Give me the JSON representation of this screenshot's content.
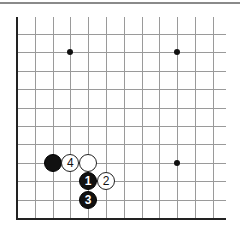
{
  "board": {
    "grid": {
      "x0": 17,
      "dx": 17.8,
      "columns": 12,
      "x_end": 226,
      "y_top": 17,
      "y0": 34,
      "dy": 18.4,
      "rows": 11,
      "y_bottom": 218
    },
    "edges": [
      "left",
      "bottom"
    ],
    "line_color": "#9a9a9a",
    "edge_color": "#222222",
    "star_points": [
      {
        "col": 3,
        "row": 1
      },
      {
        "col": 9,
        "row": 1
      },
      {
        "col": 9,
        "row": 7
      }
    ],
    "stones": [
      {
        "color": "black",
        "col": 2,
        "row": 7,
        "label": ""
      },
      {
        "color": "white",
        "col": 3,
        "row": 7,
        "label": "4"
      },
      {
        "color": "white",
        "col": 4,
        "row": 7,
        "label": ""
      },
      {
        "color": "black",
        "col": 4,
        "row": 8,
        "label": "1"
      },
      {
        "color": "white",
        "col": 5,
        "row": 8,
        "label": "2"
      },
      {
        "color": "black",
        "col": 4,
        "row": 9,
        "label": "3"
      }
    ]
  }
}
